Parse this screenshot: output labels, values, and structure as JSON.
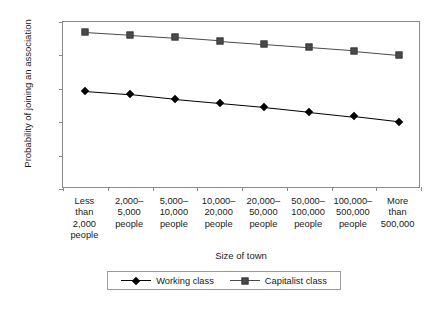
{
  "chart_data": {
    "type": "line",
    "title": "",
    "xlabel": "Size of town",
    "ylabel": "Probability of joining an association",
    "ylim": [
      0.6,
      0.85
    ],
    "yticks": [
      0.6,
      0.65,
      0.7,
      0.75,
      0.8,
      0.85
    ],
    "ytick_labels": [
      "0.6",
      "0.65",
      "0.7",
      "0.75",
      "0.8",
      "0.85"
    ],
    "grid": false,
    "legend_position": "bottom",
    "categories": [
      "Less than 2,000 people",
      "2,000–5,000 people",
      "5,000–10,000 people",
      "10,000–20,000 people",
      "20,000–50,000 people",
      "50,000–100,000 people",
      "100,000–500,000 people",
      "More than 500,000"
    ],
    "category_lines": [
      [
        "Less",
        "than",
        "2,000",
        "people"
      ],
      [
        "2,000–",
        "5,000",
        "people"
      ],
      [
        "5,000–",
        "10,000",
        "people"
      ],
      [
        "10,000–",
        "20,000",
        "people"
      ],
      [
        "20,000–",
        "50,000",
        "people"
      ],
      [
        "50,000–",
        "100,000",
        "people"
      ],
      [
        "100,000–",
        "500,000",
        "people"
      ],
      [
        "More",
        "than",
        "500,000"
      ]
    ],
    "series": [
      {
        "name": "Working class",
        "marker": "diamond",
        "color": "#000000",
        "values": [
          0.747,
          0.742,
          0.735,
          0.729,
          0.723,
          0.716,
          0.709,
          0.701
        ]
      },
      {
        "name": "Capitalist class",
        "marker": "square",
        "color": "#4a4a4a",
        "values": [
          0.835,
          0.831,
          0.827,
          0.822,
          0.817,
          0.812,
          0.807,
          0.801
        ]
      }
    ]
  },
  "legend": {
    "items": [
      {
        "label": "Working class"
      },
      {
        "label": "Capitalist class"
      }
    ]
  },
  "caption": ""
}
